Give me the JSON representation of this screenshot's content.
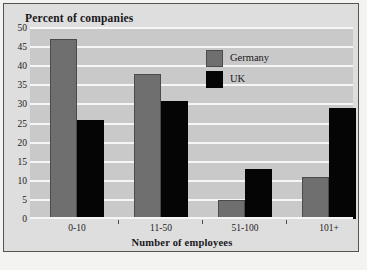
{
  "chart_data": {
    "type": "bar",
    "title": "Percent of companies",
    "xlabel": "Number of employees",
    "ylabel": "",
    "categories": [
      "0-10",
      "11-50",
      "51-100",
      "101+"
    ],
    "series": [
      {
        "name": "Germany",
        "color": "#6f6f6f",
        "values": [
          47,
          38,
          5,
          11
        ]
      },
      {
        "name": "UK",
        "color": "#050505",
        "values": [
          26,
          31,
          13,
          29
        ]
      }
    ],
    "ylim": [
      0,
      50
    ],
    "yticks": [
      0,
      5,
      10,
      15,
      20,
      25,
      30,
      35,
      40,
      45,
      50
    ],
    "ytick_labels": [
      "0",
      "5",
      "10",
      "15",
      "20",
      "25",
      "30",
      "35",
      "40",
      "45",
      "50"
    ],
    "grid": true,
    "grid_color": "#f6f6f6",
    "plot_background": "#c9c9c9",
    "figure_background": "#dedede",
    "legend_position": "upper center"
  },
  "legend": {
    "entries": [
      {
        "label": "Germany",
        "swatch": "germany"
      },
      {
        "label": "UK",
        "swatch": "uk"
      }
    ]
  }
}
